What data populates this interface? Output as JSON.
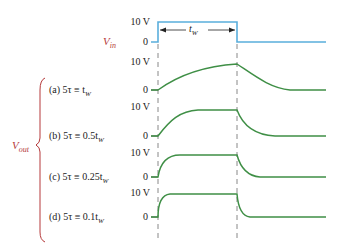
{
  "colors": {
    "input_pulse": "#5aaedc",
    "output_curve": "#3f8f46",
    "dashed_guides": "#888888",
    "signal_label": "#b5393a",
    "text": "#222222"
  },
  "input": {
    "label": "V",
    "label_sub": "in",
    "top_level": "10 V",
    "zero_level": "0",
    "pulse_width_label": "t",
    "pulse_width_sub": "W"
  },
  "output": {
    "label": "V",
    "label_sub": "out",
    "cases": [
      {
        "id": "a",
        "text": "(a) 5τ ≡ t",
        "sub": "W",
        "top_level": "10 V",
        "zero_level": "0"
      },
      {
        "id": "b",
        "text": "(b) 5τ ≡ 0.5t",
        "sub": "W",
        "top_level": "10 V",
        "zero_level": "0"
      },
      {
        "id": "c",
        "text": "(c) 5τ ≡ 0.25t",
        "sub": "W",
        "top_level": "10 V",
        "zero_level": "0"
      },
      {
        "id": "d",
        "text": "(d) 5τ ≡ 0.1t",
        "sub": "W",
        "top_level": "10 V",
        "zero_level": "0"
      }
    ]
  }
}
